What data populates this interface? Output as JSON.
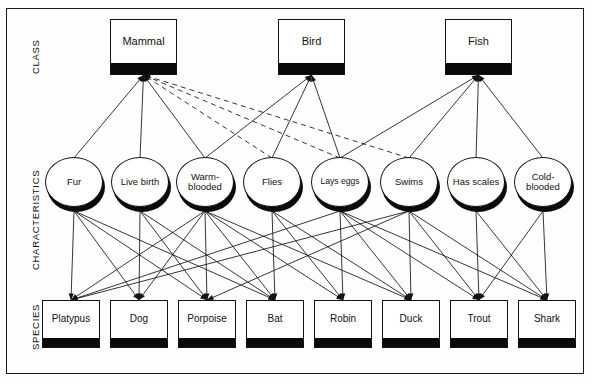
{
  "diagram": {
    "colors": {
      "stroke": "#121212",
      "band": "#0a0a0a",
      "face": "#ffffff",
      "frame": "#1a1a1a",
      "background": "#fefefe"
    },
    "row_labels": [
      {
        "id": "class",
        "label": "CLASS",
        "x": 30,
        "y": 74
      },
      {
        "id": "characteristics",
        "label": "CHARACTERISTICS",
        "x": 30,
        "y": 270
      },
      {
        "id": "species",
        "label": "SPECIES",
        "x": 30,
        "y": 350
      }
    ],
    "class_nodes": [
      {
        "id": "mammal",
        "label": "Mammal",
        "x": 110,
        "y": 19,
        "w": 67,
        "h": 56
      },
      {
        "id": "bird",
        "label": "Bird",
        "x": 278,
        "y": 19,
        "w": 67,
        "h": 56
      },
      {
        "id": "fish",
        "label": "Fish",
        "x": 445,
        "y": 19,
        "w": 67,
        "h": 56
      }
    ],
    "characteristic_nodes": [
      {
        "id": "fur",
        "label": "Fur",
        "cx": 74,
        "cy": 182,
        "rx": 29,
        "ry": 25,
        "small": false
      },
      {
        "id": "live-birth",
        "label": "Live birth",
        "cx": 140,
        "cy": 182,
        "rx": 29,
        "ry": 25,
        "small": false
      },
      {
        "id": "warm-blooded",
        "label": "Warm-blooded",
        "cx": 205,
        "cy": 182,
        "rx": 29,
        "ry": 25,
        "small": false
      },
      {
        "id": "flies",
        "label": "Flies",
        "cx": 272,
        "cy": 182,
        "rx": 29,
        "ry": 25,
        "small": false
      },
      {
        "id": "lays-eggs",
        "label": "Lays eggs",
        "cx": 340,
        "cy": 182,
        "rx": 29,
        "ry": 25,
        "small": true
      },
      {
        "id": "swims",
        "label": "Swims",
        "cx": 409,
        "cy": 182,
        "rx": 29,
        "ry": 25,
        "small": false
      },
      {
        "id": "has-scales",
        "label": "Has scales",
        "cx": 476,
        "cy": 182,
        "rx": 29,
        "ry": 25,
        "small": false
      },
      {
        "id": "cold-blooded",
        "label": "Cold-blooded",
        "cx": 543,
        "cy": 182,
        "rx": 29,
        "ry": 25,
        "small": false
      }
    ],
    "species_nodes": [
      {
        "id": "platypus",
        "label": "Platypus",
        "x": 42,
        "y": 300,
        "w": 58,
        "h": 48
      },
      {
        "id": "dog",
        "label": "Dog",
        "x": 110,
        "y": 300,
        "w": 58,
        "h": 48
      },
      {
        "id": "porpoise",
        "label": "Porpoise",
        "x": 178,
        "y": 300,
        "w": 58,
        "h": 48
      },
      {
        "id": "bat",
        "label": "Bat",
        "x": 246,
        "y": 300,
        "w": 58,
        "h": 48
      },
      {
        "id": "robin",
        "label": "Robin",
        "x": 314,
        "y": 300,
        "w": 58,
        "h": 48
      },
      {
        "id": "duck",
        "label": "Duck",
        "x": 382,
        "y": 300,
        "w": 58,
        "h": 48
      },
      {
        "id": "trout",
        "label": "Trout",
        "x": 450,
        "y": 300,
        "w": 58,
        "h": 48
      },
      {
        "id": "shark",
        "label": "Shark",
        "x": 518,
        "y": 300,
        "w": 58,
        "h": 48
      }
    ],
    "class_edges": [
      {
        "from": "mammal",
        "to": "fur",
        "style": "solid",
        "arrow": true
      },
      {
        "from": "mammal",
        "to": "live-birth",
        "style": "solid",
        "arrow": true
      },
      {
        "from": "mammal",
        "to": "warm-blooded",
        "style": "solid",
        "arrow": true
      },
      {
        "from": "mammal",
        "to": "lays-eggs",
        "style": "dashed",
        "arrow": true
      },
      {
        "from": "mammal",
        "to": "swims",
        "style": "dashed",
        "arrow": true
      },
      {
        "from": "mammal",
        "to": "flies",
        "style": "dashed",
        "arrow": true
      },
      {
        "from": "bird",
        "to": "warm-blooded",
        "style": "solid",
        "arrow": true
      },
      {
        "from": "bird",
        "to": "flies",
        "style": "solid",
        "arrow": true
      },
      {
        "from": "bird",
        "to": "lays-eggs",
        "style": "solid",
        "arrow": true
      },
      {
        "from": "fish",
        "to": "lays-eggs",
        "style": "solid",
        "arrow": true
      },
      {
        "from": "fish",
        "to": "swims",
        "style": "solid",
        "arrow": true
      },
      {
        "from": "fish",
        "to": "has-scales",
        "style": "solid",
        "arrow": true
      },
      {
        "from": "fish",
        "to": "cold-blooded",
        "style": "solid",
        "arrow": true
      }
    ],
    "species_edges": [
      {
        "from": "fur",
        "to": "platypus",
        "style": "solid",
        "arrow": true
      },
      {
        "from": "fur",
        "to": "dog",
        "style": "solid",
        "arrow": true
      },
      {
        "from": "fur",
        "to": "porpoise",
        "style": "solid",
        "arrow": true
      },
      {
        "from": "fur",
        "to": "bat",
        "style": "solid",
        "arrow": true
      },
      {
        "from": "live-birth",
        "to": "dog",
        "style": "solid",
        "arrow": true
      },
      {
        "from": "live-birth",
        "to": "porpoise",
        "style": "solid",
        "arrow": true
      },
      {
        "from": "live-birth",
        "to": "bat",
        "style": "solid",
        "arrow": true
      },
      {
        "from": "warm-blooded",
        "to": "platypus",
        "style": "solid",
        "arrow": true
      },
      {
        "from": "warm-blooded",
        "to": "dog",
        "style": "solid",
        "arrow": true
      },
      {
        "from": "warm-blooded",
        "to": "porpoise",
        "style": "solid",
        "arrow": true
      },
      {
        "from": "warm-blooded",
        "to": "bat",
        "style": "solid",
        "arrow": true
      },
      {
        "from": "warm-blooded",
        "to": "robin",
        "style": "solid",
        "arrow": true
      },
      {
        "from": "warm-blooded",
        "to": "duck",
        "style": "solid",
        "arrow": true
      },
      {
        "from": "flies",
        "to": "bat",
        "style": "solid",
        "arrow": true
      },
      {
        "from": "flies",
        "to": "robin",
        "style": "solid",
        "arrow": true
      },
      {
        "from": "flies",
        "to": "duck",
        "style": "solid",
        "arrow": true
      },
      {
        "from": "lays-eggs",
        "to": "platypus",
        "style": "solid",
        "arrow": true
      },
      {
        "from": "lays-eggs",
        "to": "robin",
        "style": "solid",
        "arrow": true
      },
      {
        "from": "lays-eggs",
        "to": "duck",
        "style": "solid",
        "arrow": true
      },
      {
        "from": "lays-eggs",
        "to": "trout",
        "style": "solid",
        "arrow": true
      },
      {
        "from": "lays-eggs",
        "to": "shark",
        "style": "solid",
        "arrow": true
      },
      {
        "from": "swims",
        "to": "platypus",
        "style": "solid",
        "arrow": true
      },
      {
        "from": "swims",
        "to": "porpoise",
        "style": "solid",
        "arrow": true
      },
      {
        "from": "swims",
        "to": "duck",
        "style": "solid",
        "arrow": true
      },
      {
        "from": "swims",
        "to": "trout",
        "style": "solid",
        "arrow": true
      },
      {
        "from": "swims",
        "to": "shark",
        "style": "solid",
        "arrow": true
      },
      {
        "from": "has-scales",
        "to": "trout",
        "style": "solid",
        "arrow": true
      },
      {
        "from": "has-scales",
        "to": "shark",
        "style": "solid",
        "arrow": true
      },
      {
        "from": "cold-blooded",
        "to": "trout",
        "style": "solid",
        "arrow": true
      },
      {
        "from": "cold-blooded",
        "to": "shark",
        "style": "solid",
        "arrow": true
      }
    ]
  }
}
